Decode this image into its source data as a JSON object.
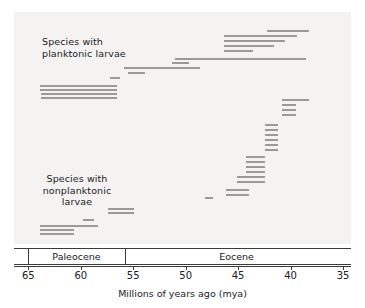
{
  "chart_data": {
    "type": "bar",
    "title": "",
    "xlabel": "Millions of years ago (mya)",
    "ylabel": "",
    "xlim": [
      65,
      35
    ],
    "x_ticks": [
      65,
      60,
      55,
      50,
      45,
      40,
      35
    ],
    "grid": false,
    "orientation": "horizontal-ranges",
    "legend_position": "in-plot annotations",
    "annotations": [
      {
        "name": "planktonic-group",
        "text": "Species with\nplanktonic larvae"
      },
      {
        "name": "nonplanktonic-group",
        "text": "Species with\nnonplanktonic\nlarvae"
      }
    ],
    "epochs": [
      {
        "name": "Paleocene",
        "start": 65,
        "end": 55.8
      },
      {
        "name": "Eocene",
        "start": 55.8,
        "end": 34.5
      }
    ],
    "series": [
      {
        "name": "Species with planktonic larvae",
        "color": "#9a9a9a",
        "ranges": [
          {
            "start": 42.2,
            "end": 38.2
          },
          {
            "start": 46.3,
            "end": 39.4
          },
          {
            "start": 46.3,
            "end": 40.5
          },
          {
            "start": 46.3,
            "end": 41.6
          },
          {
            "start": 46.3,
            "end": 43.6
          },
          {
            "start": 51.0,
            "end": 38.5
          },
          {
            "start": 51.3,
            "end": 49.7
          },
          {
            "start": 55.9,
            "end": 48.6
          },
          {
            "start": 55.5,
            "end": 53.9
          },
          {
            "start": 57.2,
            "end": 56.3
          },
          {
            "start": 63.9,
            "end": 56.5
          },
          {
            "start": 63.9,
            "end": 56.5
          },
          {
            "start": 63.8,
            "end": 56.5
          },
          {
            "start": 63.8,
            "end": 56.5
          }
        ]
      },
      {
        "name": "Species with nonplanktonic larvae",
        "color": "#9a9a9a",
        "ranges": [
          {
            "start": 40.8,
            "end": 38.2
          },
          {
            "start": 40.8,
            "end": 39.5
          },
          {
            "start": 40.8,
            "end": 39.5
          },
          {
            "start": 40.8,
            "end": 39.5
          },
          {
            "start": 42.4,
            "end": 41.2
          },
          {
            "start": 42.4,
            "end": 41.2
          },
          {
            "start": 42.4,
            "end": 41.2
          },
          {
            "start": 42.4,
            "end": 41.2
          },
          {
            "start": 42.4,
            "end": 41.2
          },
          {
            "start": 42.4,
            "end": 41.2
          },
          {
            "start": 44.2,
            "end": 42.4
          },
          {
            "start": 44.2,
            "end": 42.4
          },
          {
            "start": 44.2,
            "end": 42.4
          },
          {
            "start": 44.2,
            "end": 42.4
          },
          {
            "start": 45.1,
            "end": 42.4
          },
          {
            "start": 45.1,
            "end": 42.4
          },
          {
            "start": 46.2,
            "end": 44.0
          },
          {
            "start": 46.2,
            "end": 44.0
          },
          {
            "start": 48.2,
            "end": 47.4
          },
          {
            "start": 57.4,
            "end": 54.9
          },
          {
            "start": 57.4,
            "end": 54.9
          },
          {
            "start": 59.8,
            "end": 58.7
          },
          {
            "start": 63.9,
            "end": 58.4
          },
          {
            "start": 63.9,
            "end": 60.6
          },
          {
            "start": 63.9,
            "end": 60.6
          }
        ]
      }
    ]
  },
  "axis": {
    "tick_labels": [
      "65",
      "60",
      "55",
      "50",
      "45",
      "40",
      "35"
    ],
    "title": "Millions of years ago (mya)"
  },
  "epoch_labels": [
    "Paleocene",
    "Eocene"
  ],
  "group_labels": {
    "planktonic": "Species with\nplanktonic larvae",
    "nonplanktonic": "Species with\nnonplanktonic\nlarvae"
  },
  "bar_rows": {
    "planktonic_y": [
      30,
      35,
      40,
      45,
      50,
      58,
      62,
      67,
      72,
      77,
      85,
      89,
      93,
      97
    ],
    "nonplanktonic_y": [
      99,
      104,
      109,
      114,
      124,
      129,
      134,
      139,
      144,
      149,
      156,
      161,
      166,
      171,
      176,
      181,
      189,
      194,
      197,
      208,
      212,
      219,
      225,
      229,
      233
    ]
  }
}
